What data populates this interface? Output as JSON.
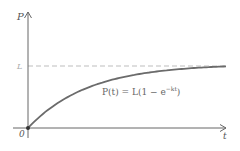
{
  "chart_data": {
    "type": "line",
    "title": "",
    "xlabel": "t",
    "ylabel": "P",
    "origin_label": "0",
    "asymptote_label": "L",
    "asymptote_style": "dashed",
    "annotation": "P(t) = L(1 − e^(−kt))",
    "annotation_parts": {
      "base": "P(t) = L(1 − e",
      "exponent": "−kt",
      "close": ")"
    },
    "grid": false,
    "series": [
      {
        "name": "P(t)",
        "x": [
          0,
          0.25,
          0.5,
          1,
          1.5,
          2,
          3,
          4,
          5,
          6
        ],
        "values": [
          0,
          0.22,
          0.39,
          0.63,
          0.78,
          0.86,
          0.95,
          0.98,
          0.99,
          1.0
        ]
      }
    ],
    "xlim": [
      0,
      6
    ],
    "ylim": [
      0,
      1.6
    ],
    "colors": {
      "curve": "#6b6b6b",
      "axes": "#666666",
      "asymptote": "#bdbdbd"
    }
  }
}
